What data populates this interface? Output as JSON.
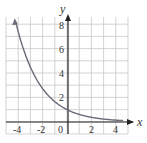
{
  "chart_data": {
    "type": "line",
    "title": "",
    "xlabel": "x",
    "ylabel": "y",
    "xlim": [
      -5,
      5
    ],
    "ylim": [
      -1,
      9
    ],
    "grid": true,
    "x_ticks": [
      "-4",
      "-2",
      "0",
      "2",
      "4"
    ],
    "y_ticks": [
      "2",
      "4",
      "6",
      "8"
    ],
    "series": [
      {
        "name": "exponential decay",
        "x": [
          -4.2,
          -4,
          -3,
          -2,
          -1,
          0,
          1,
          2,
          3,
          4,
          4.5
        ],
        "values": [
          8.2,
          7.4,
          4.5,
          2.7,
          1.6,
          1.0,
          0.6,
          0.37,
          0.22,
          0.14,
          0.1
        ]
      }
    ],
    "colors": {
      "curve": "#6b6b7a",
      "grid": "#c8c8c8",
      "axis": "#222222"
    }
  },
  "labels": {
    "x_axis": "x",
    "y_axis": "y",
    "x_ticks": [
      "-4",
      "-2",
      "0",
      "2",
      "4"
    ],
    "y_ticks": [
      "2",
      "4",
      "6",
      "8"
    ]
  }
}
